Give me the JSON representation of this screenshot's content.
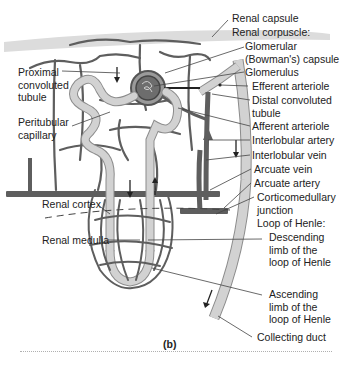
{
  "figure": {
    "caption": "(b)",
    "colors": {
      "vessel": "#5e5e5e",
      "tubule": "#c8c8c8",
      "tubule_outline": "#8a8a8a",
      "capsule_band": "#d9d9d9",
      "leader_line": "#444444",
      "text": "#222222"
    },
    "labels_right": [
      {
        "id": "renal-capsule",
        "lines": [
          "Renal capsule"
        ]
      },
      {
        "id": "renal-corpuscle",
        "lines": [
          "Renal corpuscle:"
        ]
      },
      {
        "id": "glomerular-capsule",
        "lines": [
          "Glomerular",
          "(Bowman's) capsule"
        ]
      },
      {
        "id": "glomerulus",
        "lines": [
          "Glomerulus"
        ]
      },
      {
        "id": "efferent-arteriole",
        "lines": [
          "Efferent arteriole"
        ]
      },
      {
        "id": "distal-convoluted-tubule",
        "lines": [
          "Distal convoluted",
          "tubule"
        ]
      },
      {
        "id": "afferent-arteriole",
        "lines": [
          "Afferent arteriole"
        ]
      },
      {
        "id": "interlobular-artery",
        "lines": [
          "Interlobular artery"
        ]
      },
      {
        "id": "interlobular-vein",
        "lines": [
          "Interlobular vein"
        ]
      },
      {
        "id": "arcuate-vein",
        "lines": [
          "Arcuate vein"
        ]
      },
      {
        "id": "arcuate-artery",
        "lines": [
          "Arcuate artery"
        ]
      },
      {
        "id": "corticomedullary-junction",
        "lines": [
          "Corticomedullary",
          "junction"
        ]
      },
      {
        "id": "loop-of-henle",
        "lines": [
          "Loop of Henle:"
        ]
      },
      {
        "id": "descending-limb",
        "lines": [
          "Descending",
          "limb of the",
          "loop of Henle"
        ]
      },
      {
        "id": "ascending-limb",
        "lines": [
          "Ascending",
          "limb of the",
          "loop of Henle"
        ]
      },
      {
        "id": "collecting-duct",
        "lines": [
          "Collecting duct"
        ]
      }
    ],
    "labels_left": [
      {
        "id": "proximal-convoluted-tubule",
        "lines": [
          "Proximal",
          "convoluted",
          "tubule"
        ]
      },
      {
        "id": "peritubular-capillary",
        "lines": [
          "Peritubular",
          "capillary"
        ]
      },
      {
        "id": "renal-cortex",
        "lines": [
          "Renal cortex"
        ]
      },
      {
        "id": "renal-medulla",
        "lines": [
          "Renal medulla"
        ]
      }
    ]
  }
}
